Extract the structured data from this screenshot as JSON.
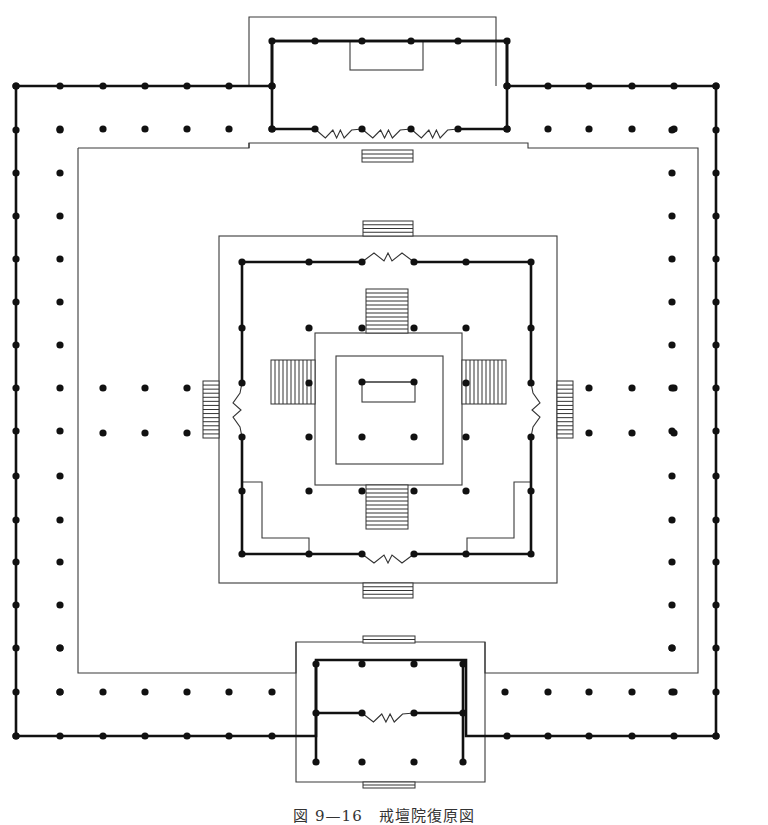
{
  "caption": "図 9—16　戒壇院復原図",
  "colors": {
    "ink": "#111111",
    "thin_line": "#3a3a3a",
    "paper": "#ffffff"
  },
  "legend": {
    "thick_line": "wall",
    "thin_line": "platform / courtyard edge",
    "dot": "column",
    "zigzag": "door opening",
    "hatched_rect": "stair"
  },
  "outer_corridor": {
    "wall_polyline": [
      [
        16,
        86
      ],
      [
        272,
        86
      ],
      [
        272,
        41
      ],
      [
        507,
        41
      ],
      [
        507,
        86
      ],
      [
        716,
        86
      ],
      [
        716,
        736
      ],
      [
        466,
        736
      ],
      [
        466,
        660
      ],
      [
        316,
        660
      ],
      [
        316,
        736
      ],
      [
        16,
        736
      ],
      [
        16,
        86
      ]
    ],
    "left_wall_x": 16,
    "right_wall_x": 716,
    "top_wall_y": 86,
    "bottom_wall_y": 736,
    "inner_col_x_left": 60,
    "inner_col_x_right": 672,
    "inner_col_y_top": 129,
    "inner_col_y_bottom": 692,
    "col_step": 43
  },
  "courtyard_edge": [
    [
      78,
      148
    ],
    [
      249,
      148
    ],
    [
      249,
      143
    ],
    [
      528,
      143
    ],
    [
      528,
      148
    ],
    [
      698,
      148
    ],
    [
      698,
      673
    ],
    [
      485,
      673
    ],
    [
      485,
      642
    ],
    [
      296,
      642
    ],
    [
      296,
      673
    ],
    [
      78,
      673
    ],
    [
      78,
      148
    ]
  ],
  "top_gate": {
    "frame": [
      [
        249,
        17
      ],
      [
        249,
        86
      ],
      [
        249,
        86
      ]
    ],
    "frame_rect": [
      249,
      17,
      247,
      131
    ],
    "wall_rect": [
      272,
      41,
      235,
      88
    ],
    "altar_rect": [
      350,
      41,
      73,
      29
    ],
    "columns": [
      [
        272,
        41
      ],
      [
        315,
        41
      ],
      [
        362,
        41
      ],
      [
        411,
        41
      ],
      [
        458,
        41
      ],
      [
        507,
        41
      ],
      [
        272,
        86
      ],
      [
        507,
        86
      ],
      [
        272,
        129
      ],
      [
        315,
        129
      ],
      [
        362,
        129
      ],
      [
        411,
        129
      ],
      [
        458,
        129
      ],
      [
        507,
        129
      ]
    ],
    "doors": [
      [
        315,
        129,
        362,
        129
      ],
      [
        362,
        129,
        411,
        129
      ],
      [
        411,
        129,
        458,
        129
      ]
    ],
    "stair": [
      362,
      150,
      51,
      12
    ]
  },
  "bottom_gate": {
    "frame": [
      [
        296,
        642
      ],
      [
        296,
        782
      ],
      [
        485,
        782
      ],
      [
        485,
        642
      ]
    ],
    "top_stair": [
      363,
      636,
      52,
      7
    ],
    "bottom_stair": [
      363,
      782,
      52,
      6
    ],
    "columns": [
      [
        316,
        664
      ],
      [
        362,
        664
      ],
      [
        414,
        664
      ],
      [
        463,
        664
      ],
      [
        316,
        713
      ],
      [
        362,
        713
      ],
      [
        414,
        713
      ],
      [
        463,
        713
      ],
      [
        316,
        762
      ],
      [
        362,
        762
      ],
      [
        414,
        762
      ],
      [
        463,
        762
      ]
    ],
    "walls": [
      [
        [
          316,
          664
        ],
        [
          316,
          762
        ]
      ],
      [
        [
          463,
          664
        ],
        [
          463,
          762
        ]
      ],
      [
        [
          316,
          713
        ],
        [
          362,
          713
        ]
      ],
      [
        [
          414,
          713
        ],
        [
          463,
          713
        ]
      ]
    ],
    "doors": [
      [
        362,
        713,
        414,
        713
      ]
    ]
  },
  "main_hall": {
    "platform_rect": [
      219,
      236,
      338,
      347
    ],
    "top_stair": [
      363,
      221,
      50,
      15
    ],
    "bottom_stair": [
      363,
      583,
      50,
      15
    ],
    "left_stair": [
      203,
      381,
      16,
      57
    ],
    "right_stair": [
      557,
      381,
      16,
      57
    ],
    "wall_path": [
      [
        242,
        262
      ],
      [
        242,
        554
      ],
      [
        309,
        554
      ],
      [
        362,
        554
      ]
    ],
    "walls": [
      [
        [
          242,
          262
        ],
        [
          362,
          262
        ]
      ],
      [
        [
          414,
          262
        ],
        [
          531,
          262
        ]
      ],
      [
        [
          242,
          262
        ],
        [
          242,
          383
        ]
      ],
      [
        [
          242,
          437
        ],
        [
          242,
          554
        ]
      ],
      [
        [
          531,
          262
        ],
        [
          531,
          383
        ]
      ],
      [
        [
          531,
          437
        ],
        [
          531,
          554
        ]
      ],
      [
        [
          242,
          554
        ],
        [
          362,
          554
        ]
      ],
      [
        [
          414,
          554
        ],
        [
          531,
          554
        ]
      ]
    ],
    "doors": [
      [
        362,
        262,
        414,
        262,
        "h"
      ],
      [
        362,
        554,
        414,
        554,
        "h"
      ],
      [
        242,
        383,
        242,
        437,
        "v"
      ],
      [
        531,
        383,
        531,
        437,
        "v"
      ]
    ],
    "side_rooms": [
      [
        [
          242,
          482
        ],
        [
          262,
          482
        ],
        [
          262,
          538
        ],
        [
          309,
          538
        ],
        [
          309,
          554
        ]
      ],
      [
        [
          531,
          482
        ],
        [
          514,
          482
        ],
        [
          514,
          538
        ],
        [
          467,
          538
        ],
        [
          467,
          554
        ]
      ]
    ],
    "columns": [
      [
        242,
        262
      ],
      [
        309,
        262
      ],
      [
        362,
        262
      ],
      [
        414,
        262
      ],
      [
        466,
        262
      ],
      [
        531,
        262
      ],
      [
        242,
        328
      ],
      [
        309,
        328
      ],
      [
        362,
        328
      ],
      [
        414,
        328
      ],
      [
        466,
        328
      ],
      [
        531,
        328
      ],
      [
        242,
        383
      ],
      [
        309,
        383
      ],
      [
        466,
        383
      ],
      [
        531,
        383
      ],
      [
        242,
        437
      ],
      [
        309,
        437
      ],
      [
        466,
        437
      ],
      [
        531,
        437
      ],
      [
        242,
        491
      ],
      [
        309,
        491
      ],
      [
        362,
        491
      ],
      [
        414,
        491
      ],
      [
        466,
        491
      ],
      [
        531,
        491
      ],
      [
        242,
        554
      ],
      [
        309,
        554
      ],
      [
        362,
        554
      ],
      [
        414,
        554
      ],
      [
        466,
        554
      ],
      [
        531,
        554
      ]
    ]
  },
  "inner_platform": {
    "outer_rect": [
      315,
      333,
      147,
      152
    ],
    "inner_rect": [
      336,
      356,
      107,
      108
    ],
    "altar_rect": [
      362,
      382,
      53,
      20
    ],
    "inner_stair_top": [
      366,
      289,
      42,
      44
    ],
    "inner_stair_bottom": [
      366,
      485,
      42,
      44
    ],
    "inner_stair_left": [
      271,
      360,
      44,
      44
    ],
    "inner_stair_right": [
      462,
      360,
      44,
      44
    ],
    "columns": [
      [
        362,
        382
      ],
      [
        414,
        382
      ],
      [
        362,
        437
      ],
      [
        414,
        437
      ]
    ]
  },
  "courtyard_columns": [
    [
      103,
      388
    ],
    [
      145,
      388
    ],
    [
      187,
      388
    ],
    [
      103,
      433
    ],
    [
      145,
      433
    ],
    [
      187,
      433
    ],
    [
      589,
      388
    ],
    [
      632,
      388
    ],
    [
      674,
      388
    ],
    [
      589,
      433
    ],
    [
      632,
      433
    ],
    [
      674,
      433
    ]
  ]
}
